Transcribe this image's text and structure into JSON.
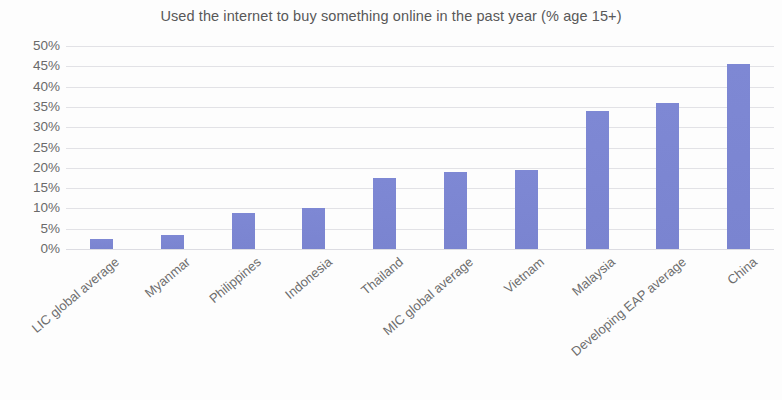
{
  "chart_data": {
    "type": "bar",
    "title": "Used the internet to buy something online in the past year (% age 15+)",
    "xlabel": "",
    "ylabel": "",
    "ylim": [
      0,
      50
    ],
    "grid": true,
    "legend": "none",
    "y_tick_labels": [
      "50%",
      "45%",
      "40%",
      "35%",
      "30%",
      "25%",
      "20%",
      "15%",
      "10%",
      "5%",
      "0%"
    ],
    "y_tick_values": [
      50,
      45,
      40,
      35,
      30,
      25,
      20,
      15,
      10,
      5,
      0
    ],
    "categories": [
      "LIC global average",
      "Myanmar",
      "Philippines",
      "Indonesia",
      "Thailand",
      "MIC global average",
      "Vietnam",
      "Malaysia",
      "Developing EAP average",
      "China"
    ],
    "values": [
      2.5,
      3.5,
      9,
      10,
      17.5,
      19,
      19.5,
      34,
      36,
      45.5
    ],
    "bar_color": "#7c86d2",
    "gridline_color": "#e2e2e6",
    "text_color": "#6a6a6a",
    "background_color": "#fdfdfd"
  }
}
